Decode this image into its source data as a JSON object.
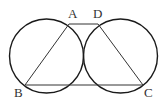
{
  "diagram": {
    "type": "geometry",
    "stroke_color": "#1a1a1a",
    "circles": [
      {
        "name": "left-circle",
        "cx": 46.5,
        "cy": 56,
        "r": 37
      },
      {
        "name": "right-circle",
        "cx": 120.5,
        "cy": 56,
        "r": 37
      }
    ],
    "points": {
      "A": {
        "label": "A",
        "x": 69,
        "y": 24
      },
      "D": {
        "label": "D",
        "x": 98,
        "y": 24
      },
      "B": {
        "label": "B",
        "x": 25,
        "y": 85
      },
      "C": {
        "label": "C",
        "x": 143,
        "y": 85
      }
    },
    "segments": [
      [
        "A",
        "D"
      ],
      [
        "A",
        "B"
      ],
      [
        "B",
        "C"
      ],
      [
        "D",
        "C"
      ]
    ],
    "labels": {
      "A": "A",
      "B": "B",
      "C": "C",
      "D": "D"
    }
  }
}
